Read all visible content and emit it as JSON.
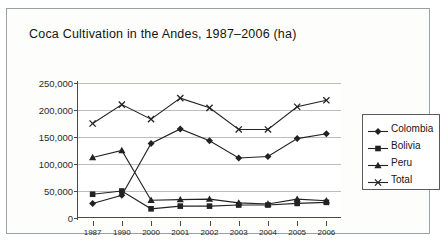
{
  "chart_data": {
    "type": "line",
    "title": "Coca Cultivation in the Andes, 1987–2006 (ha)",
    "xlabel": "",
    "ylabel": "",
    "ylim": [
      0,
      250000
    ],
    "yticks": [
      0,
      50000,
      100000,
      150000,
      200000,
      250000
    ],
    "ytick_labels": [
      "0",
      "50,000",
      "100,000",
      "150,000",
      "200,000",
      "250,000"
    ],
    "categories": [
      "1987",
      "1990",
      "2000",
      "2001",
      "2002",
      "2003",
      "2004",
      "2005",
      "2006"
    ],
    "grid": true,
    "legend_position": "right",
    "series": [
      {
        "name": "Colombia",
        "marker": "diamond",
        "color": "#222222",
        "values": [
          27000,
          42000,
          138000,
          165000,
          143000,
          111000,
          114000,
          147000,
          156000
        ]
      },
      {
        "name": "Bolivia",
        "marker": "square",
        "color": "#222222",
        "values": [
          44000,
          50000,
          17000,
          22000,
          22000,
          24000,
          24000,
          27000,
          29000
        ]
      },
      {
        "name": "Peru",
        "marker": "triangle",
        "color": "#222222",
        "values": [
          112000,
          125000,
          33000,
          34000,
          35000,
          28000,
          26000,
          35000,
          32000
        ]
      },
      {
        "name": "Total",
        "marker": "cross",
        "color": "#222222",
        "values": [
          175000,
          210000,
          183000,
          222000,
          204000,
          164000,
          164000,
          206000,
          218000
        ]
      }
    ]
  },
  "legend": {
    "entries": [
      {
        "label": "Colombia"
      },
      {
        "label": "Bolivia"
      },
      {
        "label": "Peru"
      },
      {
        "label": "Total"
      }
    ]
  }
}
